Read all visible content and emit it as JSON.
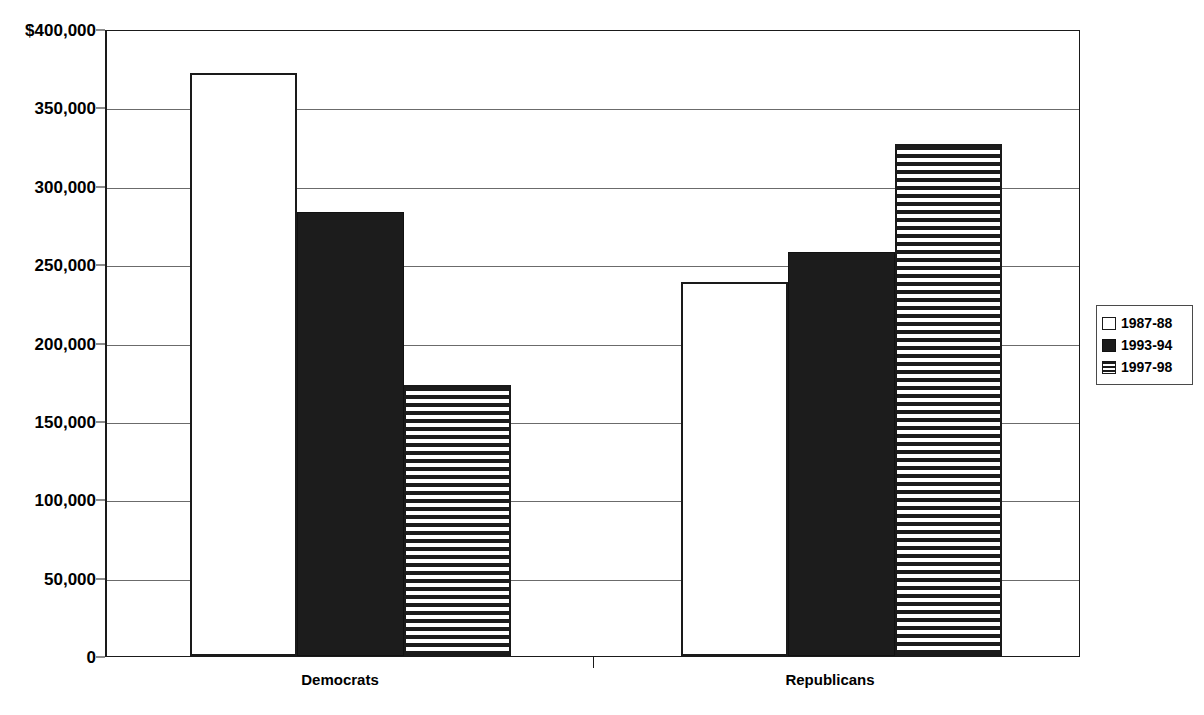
{
  "chart_data": {
    "type": "bar",
    "title": "",
    "subtitle": "",
    "xlabel": "",
    "ylabel": "",
    "categories": [
      "Democrats",
      "Republicans"
    ],
    "series": [
      {
        "name": "1987-88",
        "values": [
          372000,
          238500
        ],
        "fill": "white",
        "color": "#ffffff"
      },
      {
        "name": "1993-94",
        "values": [
          283000,
          257500
        ],
        "fill": "solid-black",
        "color": "#1c1c1c"
      },
      {
        "name": "1997-98",
        "values": [
          173000,
          326500
        ],
        "fill": "horizontal-stripes",
        "color": "#1c1c1c"
      }
    ],
    "ylim": [
      0,
      400000
    ],
    "ytick_values": [
      0,
      50000,
      100000,
      150000,
      200000,
      250000,
      300000,
      350000,
      400000
    ],
    "ytick_labels": [
      "0",
      "50,000",
      "100,000",
      "150,000",
      "200,000",
      "250,000",
      "300,000",
      "350,000",
      "$400,000"
    ],
    "grid": true,
    "grid_axis": "y",
    "legend_position": "right",
    "legend_entries": [
      "1987-88",
      "1993-94",
      "1997-98"
    ],
    "annotations": []
  },
  "legend": {
    "items": [
      {
        "label": "1987-88",
        "swatch": "white-square-icon"
      },
      {
        "label": "1993-94",
        "swatch": "black-square-icon"
      },
      {
        "label": "1997-98",
        "swatch": "striped-square-icon"
      }
    ]
  }
}
